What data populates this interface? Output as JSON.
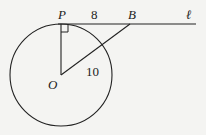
{
  "diagram": {
    "type": "geometry",
    "points": {
      "P": {
        "label": "P",
        "x": 61,
        "y": 24
      },
      "B": {
        "label": "B",
        "x": 130,
        "y": 24
      },
      "O": {
        "label": "O",
        "x": 61,
        "y": 75
      }
    },
    "line_label": "ℓ",
    "segment_labels": {
      "PB": "8",
      "OB": "10"
    },
    "circle": {
      "cx": 61,
      "cy": 75,
      "r": 51
    },
    "right_angle_at": "P",
    "stroke_color": "#222222"
  }
}
